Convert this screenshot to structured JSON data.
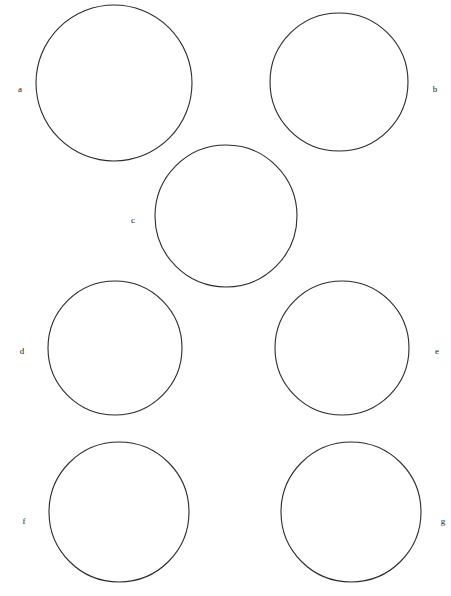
{
  "figure": {
    "kind": "micrograph-plate",
    "background_color": "#ffffff",
    "ink_color": "#2b2b2b",
    "width": 451,
    "height": 596,
    "panel_count": 7
  },
  "panels": [
    {
      "id": "a",
      "label": "a",
      "label_x": 14,
      "label_y": 85,
      "cx": 114,
      "cy": 83,
      "r": 78,
      "cell_size": 11,
      "jitter": 0.42,
      "roughness": "high",
      "stroke_width": 0.55,
      "stroke_color": "#4a4a4a",
      "seed": 11,
      "description": "dense fine crinkled cells, fuzzy dotted boundaries"
    },
    {
      "id": "b",
      "label": "b",
      "label_x": 429,
      "label_y": 85,
      "cx": 339,
      "cy": 82,
      "r": 69,
      "cell_size": 13,
      "jitter": 0.28,
      "roughness": "none",
      "stroke_width": 0.85,
      "stroke_color": "#2b2b2b",
      "seed": 23,
      "description": "large angular polygonal cells with clean straight dark outlines"
    },
    {
      "id": "c",
      "label": "c",
      "label_x": 127,
      "label_y": 216,
      "cx": 226,
      "cy": 216,
      "r": 71,
      "cell_size": 8,
      "jitter": 0.5,
      "roughness": "very-high",
      "stroke_width": 0.45,
      "stroke_color": "#555555",
      "seed": 37,
      "description": "finest densest granular texture, very small cells"
    },
    {
      "id": "d",
      "label": "d",
      "label_x": 16,
      "label_y": 347,
      "cx": 115,
      "cy": 348,
      "r": 67,
      "cell_size": 13,
      "jitter": 0.4,
      "roughness": "high",
      "stroke_width": 0.6,
      "stroke_color": "#454545",
      "seed": 53,
      "description": "medium irregular cells with crinkled boundaries"
    },
    {
      "id": "e",
      "label": "e",
      "label_x": 431,
      "label_y": 347,
      "cx": 342,
      "cy": 348,
      "r": 67,
      "cell_size": 11,
      "jitter": 0.45,
      "roughness": "high",
      "stroke_width": 0.55,
      "stroke_color": "#4a4a4a",
      "seed": 71,
      "description": "medium-fine irregular cells, slightly finer than d"
    },
    {
      "id": "f",
      "label": "f",
      "label_x": 18,
      "label_y": 517,
      "cx": 119,
      "cy": 512,
      "r": 70,
      "cell_size": 16,
      "jitter": 0.38,
      "roughness": "medium",
      "stroke_width": 0.7,
      "stroke_color": "#3a3a3a",
      "seed": 97,
      "description": "larger well-defined irregular cells"
    },
    {
      "id": "g",
      "label": "g",
      "label_x": 437,
      "label_y": 517,
      "cx": 351,
      "cy": 512,
      "r": 70,
      "cell_size": 16,
      "jitter": 0.36,
      "roughness": "medium",
      "stroke_width": 0.7,
      "stroke_color": "#3a3a3a",
      "seed": 131,
      "description": "larger well-defined irregular cells, similar to f"
    }
  ]
}
